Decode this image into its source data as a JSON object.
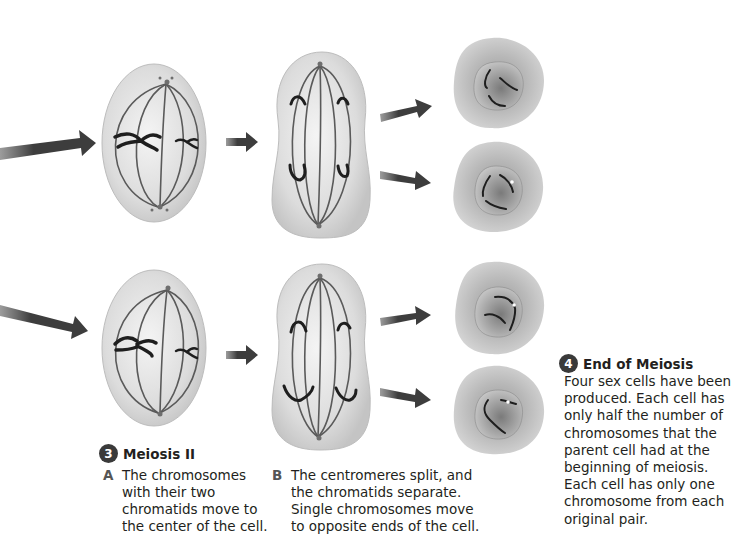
{
  "diagram": {
    "colors": {
      "cell_fill": "#d9d9d9",
      "cell_edge": "#b5b5b5",
      "spindle": "#5a5a5a",
      "chromosome": "#1e1e1e",
      "arrow": "#3f3f3f",
      "text": "#231f20",
      "badge": "#3a3a3a"
    },
    "rows": [
      {
        "label": "top-row",
        "stages": [
          "metaphase-II cell",
          "anaphase-II cell",
          "two daughter cells"
        ]
      },
      {
        "label": "bottom-row",
        "stages": [
          "metaphase-II cell",
          "anaphase-II cell",
          "two daughter cells"
        ]
      }
    ]
  },
  "section3": {
    "number": "3",
    "title": "Meiosis II",
    "steps": [
      {
        "letter": "A",
        "text": "The chromosomes\nwith their two\nchromatids move to\nthe center of the cell."
      },
      {
        "letter": "B",
        "text": "The centromeres split, and\nthe chromatids separate.\nSingle chromosomes move\nto opposite ends of the cell."
      }
    ]
  },
  "section4": {
    "number": "4",
    "title": "End of Meiosis",
    "body": "Four sex cells have been\nproduced. Each cell has\nonly half the number of\nchromosomes that the\nparent cell had at the\nbeginning of meiosis.\nEach cell has only one\nchromosome from each\noriginal pair."
  }
}
